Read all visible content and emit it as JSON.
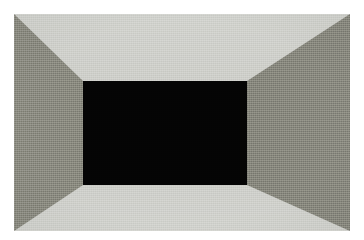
{
  "canvas": {
    "width": 364,
    "height": 240,
    "background_color": "#ffffff"
  },
  "image": {
    "title": "One-point perspective room interior",
    "description": "A rectangular box interior rendered in one-point perspective: four light and dark gray trapezoidal faces radiate from a solid black rectangular opening at the center, against a white page background. A fine woven canvas texture covers the surfaces.",
    "region": {
      "left": 14,
      "top": 14,
      "width": 336,
      "height": 217
    },
    "texture": "woven-canvas-grain"
  },
  "geometry": {
    "outer_rect": {
      "left": 0,
      "top": 0,
      "width": 336,
      "height": 217
    },
    "inner_rect": {
      "left": 69,
      "top": 67,
      "width": 164,
      "height": 104
    },
    "inner_rect_percent": {
      "x1": 20.54,
      "y1": 30.88,
      "x2": 69.35,
      "y2": 78.8
    },
    "perspective": "one-point",
    "vanishing_point": {
      "x": 151,
      "y": 119
    }
  },
  "faces": [
    {
      "id": "ceiling",
      "label": "Ceiling",
      "shape": "trapezoid",
      "position": "top",
      "color": "#c9cac4",
      "tone": "light"
    },
    {
      "id": "floor",
      "label": "Floor",
      "shape": "trapezoid",
      "position": "bottom",
      "color": "#c8c9c3",
      "tone": "light"
    },
    {
      "id": "wall-left",
      "label": "Left wall",
      "shape": "trapezoid",
      "position": "left",
      "color": "#7d7d72",
      "tone": "dark"
    },
    {
      "id": "wall-right",
      "label": "Right wall",
      "shape": "trapezoid",
      "position": "right",
      "color": "#7d7d73",
      "tone": "dark"
    },
    {
      "id": "back-wall",
      "label": "Back wall opening",
      "shape": "rectangle",
      "position": "center",
      "color": "#040404",
      "tone": "black"
    }
  ],
  "colors": {
    "page_background": "#ffffff",
    "light_face": "#c9cac4",
    "dark_face": "#7d7d72",
    "aperture": "#040404"
  }
}
